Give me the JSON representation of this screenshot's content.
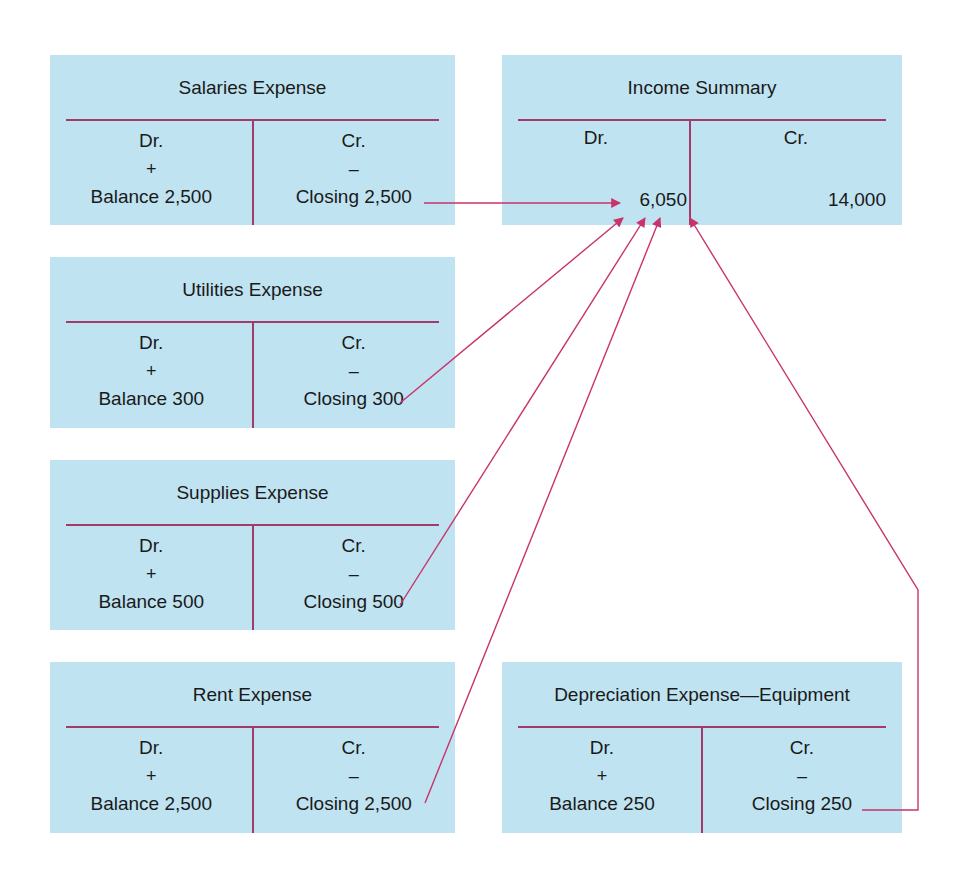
{
  "diagram": {
    "colors": {
      "account_fill": "#bfe3f1",
      "rule_line": "#a23a6b",
      "arrow": "#c8336a"
    },
    "accounts": [
      {
        "id": "salaries",
        "title": "Salaries Expense",
        "dr_label": "Dr.",
        "cr_label": "Cr.",
        "dr_sign": "+",
        "cr_sign": "–",
        "dr_entry": "Balance 2,500",
        "cr_entry": "Closing 2,500"
      },
      {
        "id": "utilities",
        "title": "Utilities Expense",
        "dr_label": "Dr.",
        "cr_label": "Cr.",
        "dr_sign": "+",
        "cr_sign": "–",
        "dr_entry": "Balance 300",
        "cr_entry": "Closing 300"
      },
      {
        "id": "supplies",
        "title": "Supplies Expense",
        "dr_label": "Dr.",
        "cr_label": "Cr.",
        "dr_sign": "+",
        "cr_sign": "–",
        "dr_entry": "Balance 500",
        "cr_entry": "Closing 500"
      },
      {
        "id": "rent",
        "title": "Rent Expense",
        "dr_label": "Dr.",
        "cr_label": "Cr.",
        "dr_sign": "+",
        "cr_sign": "–",
        "dr_entry": "Balance 2,500",
        "cr_entry": "Closing 2,500"
      },
      {
        "id": "depreciation",
        "title": "Depreciation Expense—Equipment",
        "dr_label": "Dr.",
        "cr_label": "Cr.",
        "dr_sign": "+",
        "cr_sign": "–",
        "dr_entry": "Balance 250",
        "cr_entry": "Closing 250"
      }
    ],
    "income_summary": {
      "title": "Income Summary",
      "dr_label": "Dr.",
      "cr_label": "Cr.",
      "dr_entry": "6,050",
      "cr_entry": "14,000"
    },
    "edges": [
      {
        "from": "salaries.cr_entry",
        "to": "income_summary.dr_entry"
      },
      {
        "from": "utilities.cr_entry",
        "to": "income_summary.dr_entry"
      },
      {
        "from": "supplies.cr_entry",
        "to": "income_summary.dr_entry"
      },
      {
        "from": "rent.cr_entry",
        "to": "income_summary.dr_entry"
      },
      {
        "from": "depreciation.cr_entry",
        "to": "income_summary.dr_entry"
      }
    ]
  }
}
